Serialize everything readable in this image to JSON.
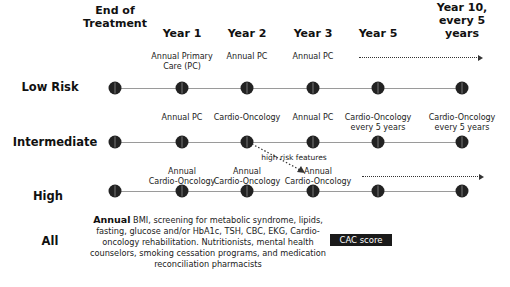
{
  "columns": [
    {
      "label": "End of\nTreatment",
      "x": 115
    },
    {
      "label": "Year 1",
      "x": 182
    },
    {
      "label": "Year 2",
      "x": 247
    },
    {
      "label": "Year 3",
      "x": 313
    },
    {
      "label": "Year 5",
      "x": 378
    },
    {
      "label": "Year 10,\nevery 5\nyears",
      "x": 462
    }
  ],
  "rows": {
    "low": {
      "label": "Low Risk"
    },
    "intermediate": {
      "label": "Intermediate"
    },
    "high": {
      "label": "High"
    },
    "all": {
      "label": "All"
    }
  },
  "notes": {
    "low": {
      "year1": "Annual Primary\nCare (PC)",
      "year2": "Annual PC",
      "year3": "Annual PC"
    },
    "intermediate": {
      "year1": "Annual PC",
      "year2": "Cardio-Oncology",
      "year3": "Annual PC",
      "year5": "Cardio-Oncology\nevery 5 years",
      "year10": "Cardio-Oncology\nevery 5 years"
    },
    "high": {
      "year1": "Annual\nCardio-Oncology",
      "year2": "Annual\nCardio-Oncology",
      "year3": "Annual\nCardio-Oncology"
    },
    "transition_label": "high risk features"
  },
  "all_row": {
    "bold_lead": "Annual",
    "text": " BMI, screening for metabolic syndrome, lipids, fasting, glucose and/or HbA1c, TSH, CBC, EKG, Cardio-oncology rehabilitation. Nutritionists, mental health counselors, smoking cessation programs, and medication reconciliation pharmacists",
    "cac_label": "CAC score"
  }
}
